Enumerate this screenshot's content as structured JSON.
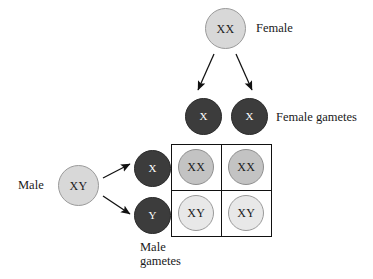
{
  "diagram": {
    "colors": {
      "parent_fill": "#d8d8d8",
      "gamete_fill": "#3c3c3c",
      "offspring_female_fill": "#c3c3c3",
      "offspring_male_fill": "#e8e8e8",
      "grid_line": "#111111",
      "arrow": "#111111",
      "text": "#1a1a1a",
      "background": "#ffffff"
    },
    "female_parent": {
      "genotype": "XX",
      "label": "Female"
    },
    "female_gametes": {
      "label": "Female gametes",
      "items": [
        {
          "genotype": "X"
        },
        {
          "genotype": "X"
        }
      ]
    },
    "male_parent": {
      "genotype": "XY",
      "label": "Male"
    },
    "male_gametes": {
      "label_line1": "Male",
      "label_line2": "gametes",
      "label": "Male gametes",
      "items": [
        {
          "genotype": "X"
        },
        {
          "genotype": "Y"
        }
      ]
    },
    "punnett": {
      "rows": [
        {
          "male_gamete": "X",
          "cells": [
            {
              "genotype": "XX",
              "sex": "female"
            },
            {
              "genotype": "XX",
              "sex": "female"
            }
          ]
        },
        {
          "male_gamete": "Y",
          "cells": [
            {
              "genotype": "XY",
              "sex": "male"
            },
            {
              "genotype": "XY",
              "sex": "male"
            }
          ]
        }
      ]
    },
    "arrows": [
      {
        "name": "female-to-gamete-left"
      },
      {
        "name": "female-to-gamete-right"
      },
      {
        "name": "male-to-gamete-x"
      },
      {
        "name": "male-to-gamete-y"
      }
    ]
  }
}
